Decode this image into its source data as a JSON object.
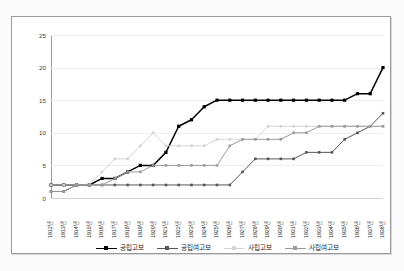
{
  "chart_data": {
    "type": "line",
    "title": "",
    "xlabel": "",
    "ylabel": "",
    "ylim": [
      0,
      25
    ],
    "yticks": [
      0,
      5,
      10,
      15,
      20,
      25
    ],
    "grid": true,
    "legend_position": "bottom",
    "categories": [
      "1912년",
      "1913년",
      "1914년",
      "1915년",
      "1916년",
      "1917년",
      "1918년",
      "1919년",
      "1920년",
      "1921년",
      "1922년",
      "1923년",
      "1924년",
      "1925년",
      "1926년",
      "1927년",
      "1928년",
      "1929년",
      "1930년",
      "1931년",
      "1932년",
      "1933년",
      "1934년",
      "1935년",
      "1936년",
      "1937년",
      "1938년"
    ],
    "series": [
      {
        "name": "공립고보",
        "color": "#000000",
        "marker": "square-filled",
        "values": [
          2,
          2,
          2,
          2,
          3,
          3,
          4,
          5,
          5,
          7,
          11,
          12,
          14,
          15,
          15,
          15,
          15,
          15,
          15,
          15,
          15,
          15,
          15,
          15,
          16,
          16,
          20
        ]
      },
      {
        "name": "공립여고보",
        "color": "#565656",
        "marker": "square-filled",
        "values": [
          1,
          1,
          2,
          2,
          2,
          2,
          2,
          2,
          2,
          2,
          2,
          2,
          2,
          2,
          2,
          4,
          6,
          6,
          6,
          6,
          7,
          7,
          7,
          9,
          10,
          11,
          13
        ]
      },
      {
        "name": "사립고보",
        "color": "#d4d4d4",
        "marker": "square-filled",
        "values": [
          2,
          2,
          2,
          2,
          4,
          6,
          6,
          8,
          10,
          8,
          8,
          8,
          8,
          9,
          9,
          9,
          9,
          11,
          11,
          11,
          11,
          11,
          11,
          11,
          11,
          11,
          11
        ]
      },
      {
        "name": "사립여고보",
        "color": "#9b9b9b",
        "marker": "square-filled",
        "values": [
          1,
          1,
          2,
          2,
          2,
          3,
          4,
          4,
          5,
          5,
          5,
          5,
          5,
          5,
          8,
          9,
          9,
          9,
          9,
          10,
          10,
          11,
          11,
          11,
          11,
          11,
          11
        ]
      }
    ]
  },
  "legend": {
    "items": [
      {
        "label": "공립고보"
      },
      {
        "label": "공립여고보"
      },
      {
        "label": "사립고보"
      },
      {
        "label": "사립여고보"
      }
    ]
  },
  "colors": {
    "frame": "#9a9a9a",
    "grid": "#eceff1",
    "background": "#ffffff",
    "page_background": "#fbfbfb"
  }
}
